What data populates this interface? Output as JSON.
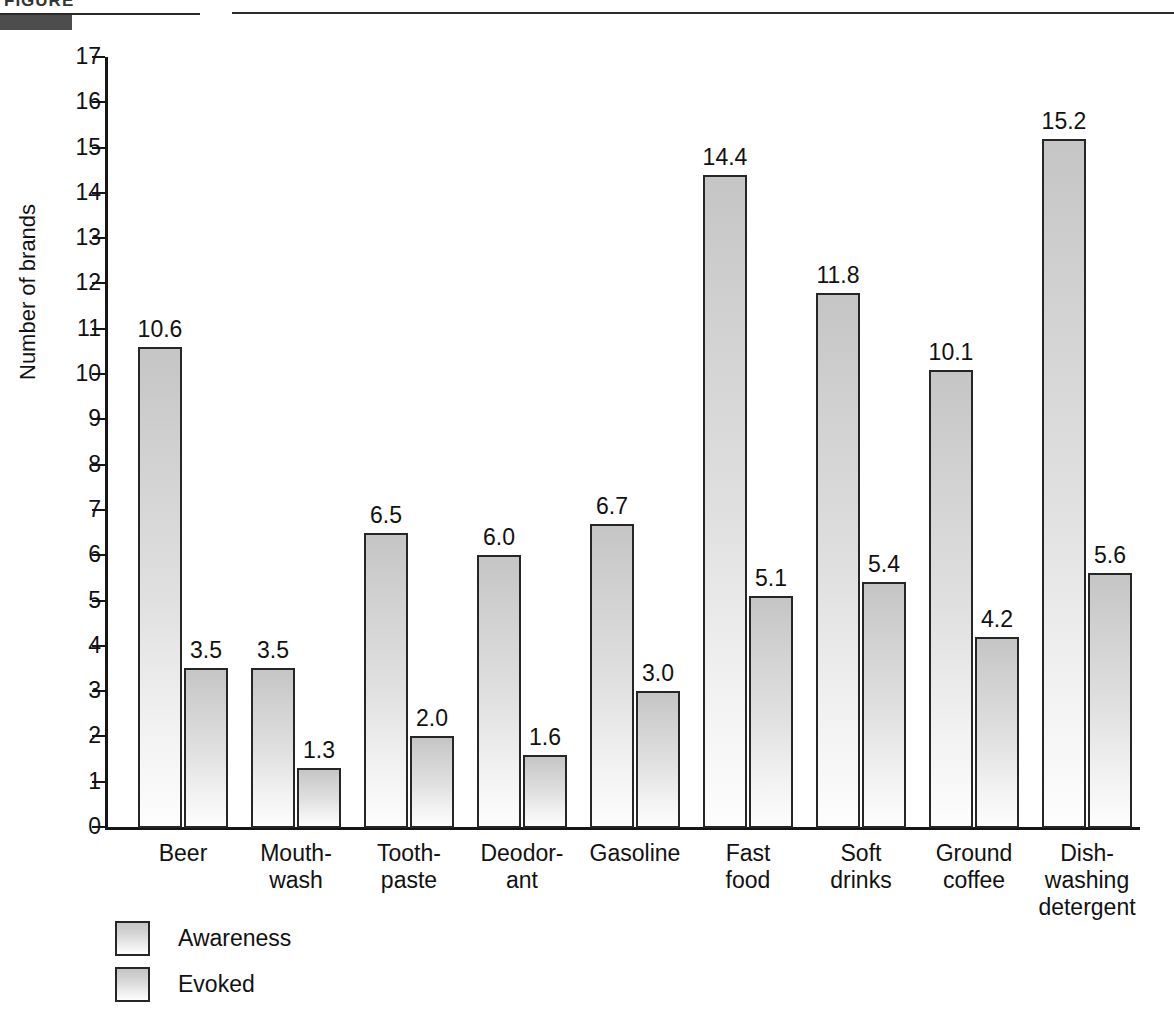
{
  "figure_header": {
    "caption_clipped": "FIGURE",
    "label_block_color": "#4d4d4d"
  },
  "chart_data": {
    "type": "bar",
    "title": "",
    "xlabel": "",
    "ylabel": "Number of brands",
    "ylim": [
      0,
      17
    ],
    "ytick_step": 1,
    "yticks": [
      "17",
      "16",
      "15",
      "14",
      "13",
      "12",
      "11",
      "10",
      "9",
      "8",
      "7",
      "6",
      "5",
      "4",
      "3",
      "2",
      "1",
      "0"
    ],
    "grid": false,
    "legend_position": "bottom-left",
    "categories": [
      "Beer",
      "Mouth-\nwash",
      "Tooth-\npaste",
      "Deodor-\nant",
      "Gasoline",
      "Fast\nfood",
      "Soft\ndrinks",
      "Ground\ncoffee",
      "Dish-\nwashing\ndetergent"
    ],
    "series": [
      {
        "name": "Awareness",
        "values": [
          10.6,
          3.5,
          6.5,
          6.0,
          6.7,
          14.4,
          11.8,
          10.1,
          15.2
        ],
        "labels": [
          "10.6",
          "3.5",
          "6.5",
          "6.0",
          "6.7",
          "14.4",
          "11.8",
          "10.1",
          "15.2"
        ],
        "color": "#cfcfcf"
      },
      {
        "name": "Evoked",
        "values": [
          3.5,
          1.3,
          2.0,
          1.6,
          3.0,
          5.1,
          5.4,
          4.2,
          5.6
        ],
        "labels": [
          "3.5",
          "1.3",
          "2.0",
          "1.6",
          "3.0",
          "5.1",
          "5.4",
          "4.2",
          "5.6"
        ],
        "color": "#cfcfcf"
      }
    ]
  },
  "legend": {
    "items": [
      {
        "label": "Awareness"
      },
      {
        "label": "Evoked"
      }
    ]
  }
}
